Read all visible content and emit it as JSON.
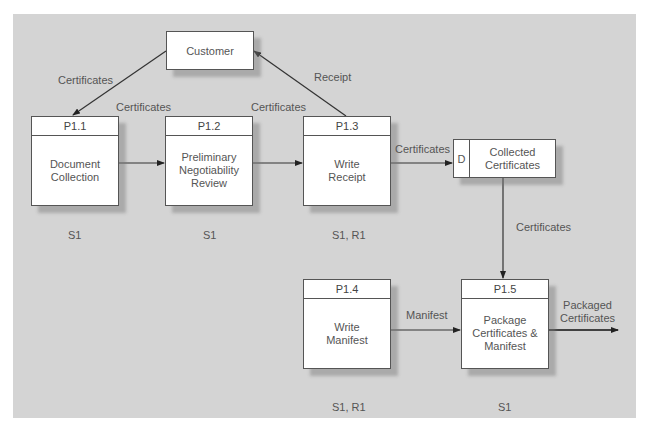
{
  "diagram": {
    "type": "data-flow-diagram",
    "external_entities": [
      {
        "id": "customer",
        "label": "Customer"
      }
    ],
    "processes": [
      {
        "id": "P1.1",
        "name": "Document\nCollection",
        "annotation": "S1"
      },
      {
        "id": "P1.2",
        "name": "Preliminary\nNegotiability\nReview",
        "annotation": "S1"
      },
      {
        "id": "P1.3",
        "name": "Write\nReceipt",
        "annotation": "S1, R1"
      },
      {
        "id": "P1.4",
        "name": "Write\nManifest",
        "annotation": "S1, R1"
      },
      {
        "id": "P1.5",
        "name": "Package\nCertificates &\nManifest",
        "annotation": "S1"
      }
    ],
    "data_stores": [
      {
        "id": "D",
        "name": "Collected\nCertificates"
      }
    ],
    "flows": [
      {
        "from": "customer",
        "to": "P1.1",
        "label": "Certificates"
      },
      {
        "from": "P1.1",
        "to": "P1.2",
        "label": "Certificates"
      },
      {
        "from": "P1.2",
        "to": "P1.3",
        "label": "Certificates"
      },
      {
        "from": "P1.3",
        "to": "customer",
        "label": "Receipt"
      },
      {
        "from": "P1.3",
        "to": "D",
        "label": "Certificates"
      },
      {
        "from": "D",
        "to": "P1.5",
        "label": "Certificates"
      },
      {
        "from": "P1.4",
        "to": "P1.5",
        "label": "Manifest"
      },
      {
        "from": "P1.5",
        "to": "external",
        "label": "Packaged\nCertificates"
      }
    ]
  },
  "colors": {
    "panel": "#d4d4d4",
    "box": "#ffffff",
    "line": "#333333",
    "text": "#555555"
  }
}
